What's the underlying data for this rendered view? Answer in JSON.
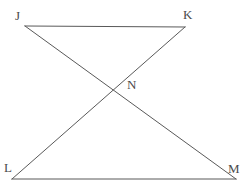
{
  "figure": {
    "background_color": "#ffffff",
    "stroke_color": "#595959",
    "label_color": "#4a4a4a",
    "stroke_width": 1,
    "labels": {
      "J": "J",
      "K": "K",
      "N": "N",
      "L": "L",
      "M": "M"
    },
    "points": {
      "J": {
        "x": 25,
        "y": 26
      },
      "K": {
        "x": 185,
        "y": 27
      },
      "N": {
        "x": 113,
        "y": 86
      },
      "L": {
        "x": 12,
        "y": 179
      },
      "M": {
        "x": 236,
        "y": 179
      }
    },
    "segments": [
      {
        "name": "JK",
        "from": "J",
        "to": "K"
      },
      {
        "name": "LM",
        "from": "L",
        "to": "M"
      },
      {
        "name": "JM",
        "from": "J",
        "to": "M"
      },
      {
        "name": "KL",
        "from": "K",
        "to": "L"
      }
    ]
  }
}
